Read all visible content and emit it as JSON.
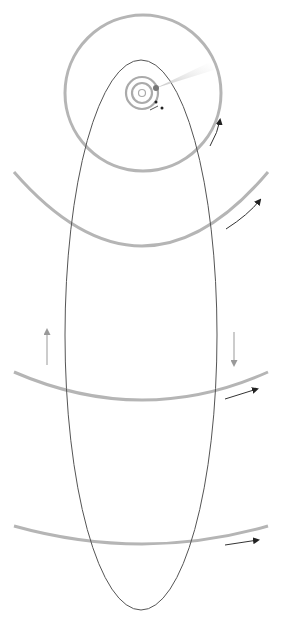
{
  "diagram": {
    "sun": {
      "cx": 142,
      "cy": 93,
      "r": 3.5
    },
    "inner_orbits": [
      {
        "cx": 142,
        "cy": 93,
        "r": 10
      },
      {
        "cx": 142,
        "cy": 93,
        "r": 16
      }
    ],
    "big_orbit": {
      "cx": 143,
      "cy": 93,
      "r": 78
    },
    "wide_orbits": [
      {
        "cx": 143,
        "cy": -185,
        "r": 430,
        "y_low": 245
      },
      {
        "cx": 143,
        "cy": -2100,
        "r": 2500,
        "y_low": 400
      },
      {
        "cx": 143,
        "cy": -4500,
        "r": 5045,
        "y_low": 545
      }
    ],
    "comet_orbit": {
      "cx": 141,
      "cy": 330,
      "rx": 76,
      "ry": 280
    },
    "comet": {
      "x": 156,
      "y": 88
    },
    "colors": {
      "orbit": "#b5b5b5",
      "comet_orbit": "#555555",
      "arrow": "#333333",
      "arrow_light": "#999999",
      "tail": "#dddddd"
    }
  }
}
